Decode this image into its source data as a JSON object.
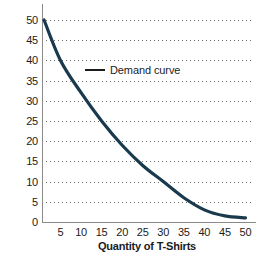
{
  "chart_data": {
    "type": "line",
    "title": "",
    "xlabel": "Quantity of T-Shirts",
    "ylabel": "Price ($)",
    "xlim": [
      0,
      52
    ],
    "ylim": [
      0,
      52
    ],
    "xticks": [
      5,
      10,
      15,
      20,
      25,
      30,
      35,
      40,
      45,
      50
    ],
    "yticks": [
      0,
      5,
      10,
      15,
      20,
      25,
      30,
      35,
      40,
      45,
      50
    ],
    "grid": "horizontal-dotted",
    "legend_position": "inline-annotation",
    "series": [
      {
        "name": "Demand curve",
        "color": "#183a4c",
        "x": [
          1,
          5,
          10,
          15,
          20,
          25,
          30,
          35,
          40,
          45,
          50
        ],
        "values": [
          50,
          40,
          32,
          25,
          19,
          14,
          10,
          6,
          3,
          1.5,
          1
        ]
      }
    ],
    "annotations": [
      {
        "text": "Demand curve",
        "x": 12,
        "y": 37
      }
    ]
  },
  "axes": {
    "y_title": "Price ($)",
    "x_title": "Quantity of T-Shirts",
    "y_tick_labels": [
      "50",
      "45",
      "40",
      "35",
      "30",
      "25",
      "20",
      "15",
      "10",
      "5",
      "0"
    ],
    "x_tick_labels": [
      "5",
      "10",
      "15",
      "20",
      "25",
      "30",
      "35",
      "40",
      "45",
      "50"
    ]
  },
  "annotation": {
    "label": "Demand curve"
  },
  "colors": {
    "curve": "#183a4c",
    "axis": "#8a8a8a",
    "grid": "#6d6d6d",
    "text": "#1b1b1b",
    "background": "#ffffff"
  }
}
